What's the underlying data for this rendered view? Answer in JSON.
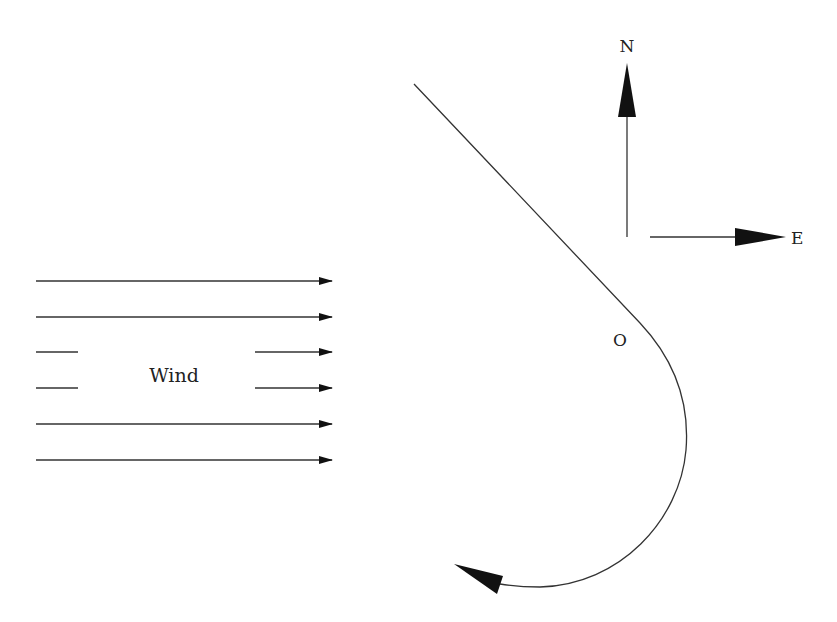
{
  "diagram": {
    "title": "",
    "labels": {
      "north": "N",
      "east": "E",
      "origin": "O",
      "wind": "Wind"
    },
    "wind": {
      "direction": "east",
      "arrow_count": 6,
      "rows_y": [
        281,
        317,
        352,
        388,
        424,
        460
      ]
    },
    "path": {
      "description": "Straight segment from northwest to point O, then clockwise curve turning south and west, ending with an arrowhead pointing west-northwest"
    },
    "colors": {
      "stroke": "#333333",
      "fill": "#111111",
      "background": "#ffffff"
    }
  }
}
